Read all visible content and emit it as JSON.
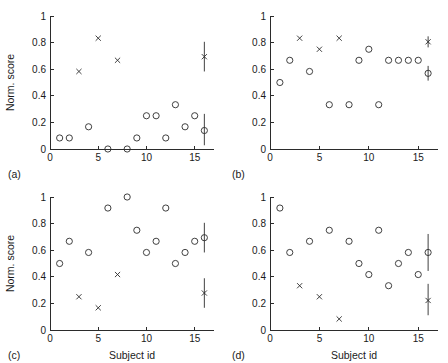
{
  "figure": {
    "title": "",
    "panel_count": 4,
    "layout": "2x2 grid of scatter plots"
  },
  "axes": {
    "ylabel": "Norm. score",
    "xlabel": "Subject id",
    "y_ticks": [
      "0",
      "0.2",
      "0.4",
      "0.6",
      "0.8",
      "1"
    ],
    "y_tick_values": [
      0,
      0.2,
      0.4,
      0.6,
      0.8,
      1
    ],
    "x_ticks": [
      "0",
      "5",
      "10",
      "15"
    ],
    "x_tick_values": [
      0,
      5,
      10,
      15
    ],
    "xlim": [
      0,
      17
    ],
    "ylim": [
      0,
      1
    ]
  },
  "panels": {
    "a": {
      "tag": "(a)",
      "show_ylabel": true,
      "show_xlabel": false
    },
    "b": {
      "tag": "(b)",
      "show_ylabel": false,
      "show_xlabel": false
    },
    "c": {
      "tag": "(c)",
      "show_ylabel": true,
      "show_xlabel": true
    },
    "d": {
      "tag": "(d)",
      "show_ylabel": false,
      "show_xlabel": true
    }
  },
  "chart_data": [
    {
      "id": "a",
      "type": "scatter",
      "title": "(a)",
      "xlabel": "",
      "ylabel": "Norm. score",
      "xlim": [
        0,
        17
      ],
      "ylim": [
        0,
        1
      ],
      "xticks": [
        0,
        5,
        10,
        15
      ],
      "yticks": [
        0,
        0.2,
        0.4,
        0.6,
        0.8,
        1
      ],
      "grid": false,
      "legend": "none",
      "series": [
        {
          "name": "circles",
          "marker": "circle",
          "x": [
            1,
            2,
            4,
            6,
            8,
            9,
            10,
            11,
            12,
            13,
            14,
            15
          ],
          "y": [
            0.083,
            0.083,
            0.167,
            0.0,
            0.0,
            0.083,
            0.25,
            0.25,
            0.083,
            0.333,
            0.167,
            0.25
          ]
        },
        {
          "name": "crosses",
          "marker": "x",
          "x": [
            3,
            5,
            7
          ],
          "y": [
            0.583,
            0.833,
            0.667
          ]
        }
      ],
      "summary_markers": [
        {
          "x": 16,
          "y": 0.694,
          "marker": "x",
          "err_low": 0.583,
          "err_high": 0.806
        },
        {
          "x": 16,
          "y": 0.139,
          "marker": "circle",
          "err_low": 0.028,
          "err_high": 0.264
        }
      ]
    },
    {
      "id": "b",
      "type": "scatter",
      "title": "(b)",
      "xlabel": "",
      "ylabel": "",
      "xlim": [
        0,
        17
      ],
      "ylim": [
        0,
        1
      ],
      "xticks": [
        0,
        5,
        10,
        15
      ],
      "yticks": [
        0,
        0.2,
        0.4,
        0.6,
        0.8,
        1
      ],
      "grid": false,
      "legend": "none",
      "series": [
        {
          "name": "circles",
          "marker": "circle",
          "x": [
            1,
            2,
            4,
            6,
            8,
            9,
            10,
            11,
            12,
            13,
            14,
            15
          ],
          "y": [
            0.5,
            0.667,
            0.583,
            0.333,
            0.333,
            0.667,
            0.75,
            0.333,
            0.667,
            0.667,
            0.667,
            0.667
          ]
        },
        {
          "name": "crosses",
          "marker": "x",
          "x": [
            3,
            5,
            7
          ],
          "y": [
            0.833,
            0.75,
            0.833
          ]
        }
      ],
      "summary_markers": [
        {
          "x": 16,
          "y": 0.806,
          "marker": "x",
          "err_low": 0.764,
          "err_high": 0.847
        },
        {
          "x": 16,
          "y": 0.569,
          "marker": "circle",
          "err_low": 0.514,
          "err_high": 0.625
        }
      ]
    },
    {
      "id": "c",
      "type": "scatter",
      "title": "(c)",
      "xlabel": "Subject id",
      "ylabel": "Norm. score",
      "xlim": [
        0,
        17
      ],
      "ylim": [
        0,
        1
      ],
      "xticks": [
        0,
        5,
        10,
        15
      ],
      "yticks": [
        0,
        0.2,
        0.4,
        0.6,
        0.8,
        1
      ],
      "grid": false,
      "legend": "none",
      "series": [
        {
          "name": "circles",
          "marker": "circle",
          "x": [
            1,
            2,
            4,
            6,
            8,
            9,
            10,
            11,
            12,
            13,
            14,
            15
          ],
          "y": [
            0.5,
            0.667,
            0.583,
            0.917,
            1.0,
            0.75,
            0.583,
            0.667,
            0.917,
            0.5,
            0.583,
            0.667
          ]
        },
        {
          "name": "crosses",
          "marker": "x",
          "x": [
            3,
            5,
            7
          ],
          "y": [
            0.25,
            0.167,
            0.417
          ]
        }
      ],
      "summary_markers": [
        {
          "x": 16,
          "y": 0.694,
          "marker": "circle",
          "err_low": 0.583,
          "err_high": 0.806
        },
        {
          "x": 16,
          "y": 0.278,
          "marker": "x",
          "err_low": 0.167,
          "err_high": 0.389
        }
      ]
    },
    {
      "id": "d",
      "type": "scatter",
      "title": "(d)",
      "xlabel": "Subject id",
      "ylabel": "",
      "xlim": [
        0,
        17
      ],
      "ylim": [
        0,
        1
      ],
      "xticks": [
        0,
        5,
        10,
        15
      ],
      "yticks": [
        0,
        0.2,
        0.4,
        0.6,
        0.8,
        1
      ],
      "grid": false,
      "legend": "none",
      "series": [
        {
          "name": "circles",
          "marker": "circle",
          "x": [
            1,
            2,
            4,
            6,
            8,
            9,
            10,
            11,
            12,
            13,
            14,
            15
          ],
          "y": [
            0.917,
            0.583,
            0.667,
            0.75,
            0.667,
            0.5,
            0.417,
            0.75,
            0.333,
            0.5,
            0.583,
            0.417
          ]
        },
        {
          "name": "crosses",
          "marker": "x",
          "x": [
            3,
            5,
            7
          ],
          "y": [
            0.333,
            0.25,
            0.083
          ]
        }
      ],
      "summary_markers": [
        {
          "x": 16,
          "y": 0.583,
          "marker": "circle",
          "err_low": 0.444,
          "err_high": 0.722
        },
        {
          "x": 16,
          "y": 0.222,
          "marker": "x",
          "err_low": 0.111,
          "err_high": 0.347
        }
      ]
    }
  ]
}
